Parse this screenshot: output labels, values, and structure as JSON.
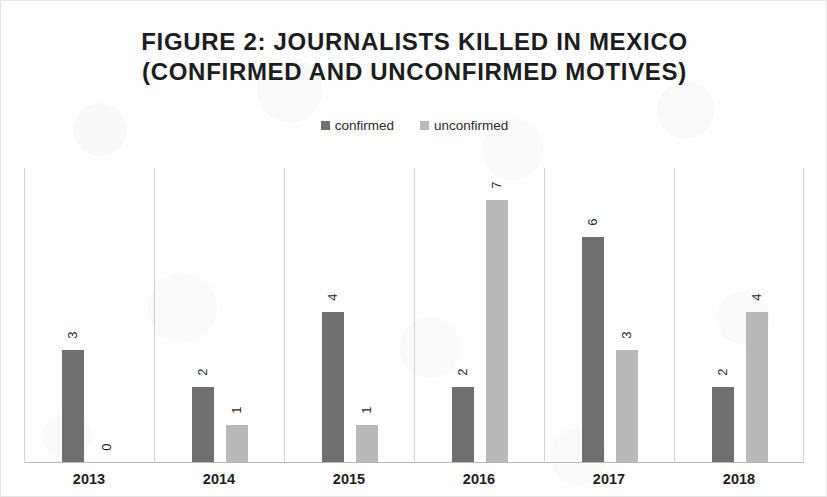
{
  "figure": {
    "title_line1": "FIGURE 2: JOURNALISTS KILLED IN MEXICO",
    "title_line2": "(CONFIRMED AND UNCONFIRMED MOTIVES)"
  },
  "legend": {
    "position": "top-center",
    "entries": [
      {
        "label": "confirmed",
        "color": "#6f6f6f",
        "swatch_name": "legend-swatch-confirmed"
      },
      {
        "label": "unconfirmed",
        "color": "#b9b9b9",
        "swatch_name": "legend-swatch-unconfirmed"
      }
    ]
  },
  "chart_data": {
    "type": "bar",
    "title": "FIGURE 2: JOURNALISTS KILLED IN MEXICO (CONFIRMED AND UNCONFIRMED MOTIVES)",
    "xlabel": "",
    "ylabel": "",
    "categories": [
      "2013",
      "2014",
      "2015",
      "2016",
      "2017",
      "2018"
    ],
    "series": [
      {
        "name": "confirmed",
        "color": "#6f6f6f",
        "values": [
          3,
          2,
          4,
          2,
          6,
          2
        ]
      },
      {
        "name": "unconfirmed",
        "color": "#b9b9b9",
        "values": [
          0,
          1,
          1,
          7,
          3,
          4
        ]
      }
    ],
    "ylim": [
      0,
      7
    ],
    "grid": false,
    "axis_visible": {
      "x": true,
      "y": false
    },
    "data_labels": true,
    "data_label_rotation": -90,
    "legend_position": "top-center"
  }
}
